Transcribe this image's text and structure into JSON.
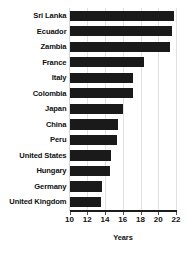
{
  "chart_data": {
    "type": "bar",
    "orientation": "horizontal",
    "title": "",
    "xlabel": "Years",
    "ylabel": "",
    "xlim": [
      10,
      22
    ],
    "xticks": [
      10,
      12,
      14,
      16,
      18,
      20,
      22
    ],
    "xtick_labels": [
      "10",
      "12",
      "14",
      "16",
      "18",
      "20",
      "22"
    ],
    "grid": true,
    "grid_axis": "x",
    "legend": false,
    "bar_color": "#1a1a1a",
    "background_color": "#ffffff",
    "gridline_color": "#e2e2e2",
    "axis_color": "#1c1c1c",
    "categories": [
      "Sri Lanka",
      "Ecuador",
      "Zambia",
      "France",
      "Italy",
      "Colombia",
      "Japan",
      "China",
      "Peru",
      "United States",
      "Hungary",
      "Germany",
      "United Kingdom"
    ],
    "values": [
      21.8,
      21.5,
      21.3,
      18.4,
      17.2,
      17.1,
      16.0,
      15.5,
      15.3,
      14.7,
      14.6,
      13.7,
      13.5
    ]
  }
}
